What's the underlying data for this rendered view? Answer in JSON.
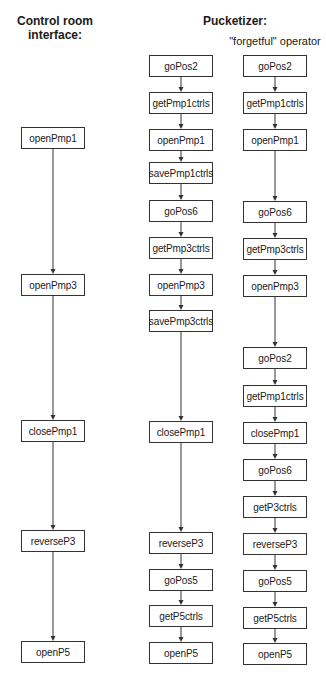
{
  "headings": {
    "left": "Control room interface:",
    "left_line1": "Control room",
    "left_line2": "interface:",
    "right": "Pucketizer:",
    "right_sub": "\"forgetful\" operator"
  },
  "columns": [
    {
      "name": "control-room",
      "x": 21,
      "w": 64,
      "nodes": [
        {
          "label": "openPmp1",
          "y": 127
        },
        {
          "label": "openPmp3",
          "y": 274
        },
        {
          "label": "closePmp1",
          "y": 420
        },
        {
          "label": "reverseP3",
          "y": 530
        },
        {
          "label": "openP5",
          "y": 641
        }
      ]
    },
    {
      "name": "pucketizer",
      "x": 149,
      "w": 64,
      "nodes": [
        {
          "label": "goPos2",
          "y": 55
        },
        {
          "label": "getPmp1ctrls",
          "y": 92
        },
        {
          "label": "openPmp1",
          "y": 129
        },
        {
          "label": "savePmp1ctrls",
          "y": 162
        },
        {
          "label": "goPos6",
          "y": 200
        },
        {
          "label": "getPmp3ctrls",
          "y": 237
        },
        {
          "label": "openPmp3",
          "y": 274
        },
        {
          "label": "savePmp3ctrls",
          "y": 310
        },
        {
          "label": "closePmp1",
          "y": 421
        },
        {
          "label": "reverseP3",
          "y": 532
        },
        {
          "label": "goPos5",
          "y": 569
        },
        {
          "label": "getP5ctrls",
          "y": 605
        },
        {
          "label": "openP5",
          "y": 642
        }
      ]
    },
    {
      "name": "forgetful-operator",
      "x": 243,
      "w": 64,
      "nodes": [
        {
          "label": "goPos2",
          "y": 55
        },
        {
          "label": "getPmp1ctrls",
          "y": 92
        },
        {
          "label": "openPmp1",
          "y": 129
        },
        {
          "label": "goPos6",
          "y": 201
        },
        {
          "label": "getPmp3ctrls",
          "y": 238
        },
        {
          "label": "openPmp3",
          "y": 275
        },
        {
          "label": "goPos2",
          "y": 347
        },
        {
          "label": "getPmp1ctrls",
          "y": 385
        },
        {
          "label": "closePmp1",
          "y": 422
        },
        {
          "label": "goPos6",
          "y": 459
        },
        {
          "label": "getP3ctrls",
          "y": 496
        },
        {
          "label": "reverseP3",
          "y": 533
        },
        {
          "label": "goPos5",
          "y": 570
        },
        {
          "label": "getP5ctrls",
          "y": 607
        },
        {
          "label": "openP5",
          "y": 643
        }
      ]
    }
  ],
  "node_height": 22,
  "colors": {
    "line": "#333333",
    "box_border": "#333333",
    "text": "#1a1a1a"
  }
}
